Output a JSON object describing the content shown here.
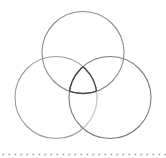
{
  "diagram": {
    "type": "venn",
    "sets": 3,
    "circles": [
      {
        "id": "top",
        "cx": 83,
        "cy": 52.5,
        "r": 41,
        "stroke": "#8a8a8a"
      },
      {
        "id": "left",
        "cx": 56,
        "cy": 97.5,
        "r": 41,
        "stroke": "#9a9a9a"
      },
      {
        "id": "right",
        "cx": 110,
        "cy": 97.5,
        "r": 41,
        "stroke": "#7a7a7a"
      }
    ],
    "center_region_stroke": "#444444",
    "divider": {
      "style": "dotted",
      "y": 154.5,
      "color": "#9a9a9a",
      "spacing": 6
    }
  }
}
